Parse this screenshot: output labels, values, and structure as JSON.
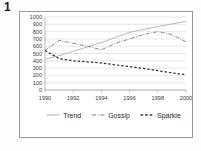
{
  "figure": {
    "number": "1"
  },
  "chart_data": {
    "type": "line",
    "title": "",
    "xlabel": "",
    "ylabel": "",
    "ylim": [
      0,
      1000
    ],
    "xlim": [
      1990,
      2000
    ],
    "grid": true,
    "legend_position": "bottom",
    "ytick_labels": [
      "1000",
      "900",
      "800",
      "700",
      "600",
      "500",
      "400",
      "300",
      "200",
      "100",
      "0"
    ],
    "ytick_values": [
      1000,
      900,
      800,
      700,
      600,
      500,
      400,
      300,
      200,
      100,
      0
    ],
    "xtick_labels": [
      "1990",
      "1992",
      "1994",
      "1996",
      "1998",
      "2000"
    ],
    "xtick_values": [
      1990,
      1992,
      1994,
      1996,
      1998,
      2000
    ],
    "x": [
      1990,
      1991,
      1992,
      1993,
      1994,
      1995,
      1996,
      1997,
      1998,
      1999,
      2000
    ],
    "series": [
      {
        "name": "Trend",
        "color": "#b9b9b9",
        "style": "solid",
        "values": [
          420,
          470,
          530,
          590,
          650,
          720,
          790,
          830,
          870,
          905,
          940
        ]
      },
      {
        "name": "Gossip",
        "color": "#8a8a8a",
        "style": "dashdot",
        "values": [
          540,
          680,
          640,
          600,
          550,
          640,
          700,
          760,
          800,
          760,
          660
        ]
      },
      {
        "name": "Sparkle",
        "color": "#333333",
        "style": "dashed",
        "values": [
          540,
          430,
          400,
          385,
          370,
          345,
          320,
          295,
          265,
          235,
          210
        ]
      }
    ]
  },
  "legend": {
    "items": [
      {
        "label": "Trend"
      },
      {
        "label": "Gossip"
      },
      {
        "label": "Sparkle"
      }
    ]
  }
}
